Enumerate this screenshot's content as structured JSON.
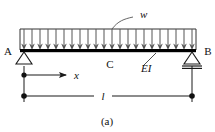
{
  "figure": {
    "caption": "(a)",
    "type": "engineering-beam-diagram"
  },
  "labels": {
    "support_left": "A",
    "support_right": "B",
    "midspan_point": "C",
    "distributed_load": "w",
    "flexural_rigidity": "EI",
    "coordinate_axis": "x",
    "span_length": "l"
  },
  "colors": {
    "line": "#1a1a1a",
    "beam": "#000000",
    "load_arrow": "#555555",
    "background": "#ffffff"
  },
  "geometry": {
    "beam_left_x": 20,
    "beam_right_x": 196,
    "beam_y": 50,
    "load_top_y": 29,
    "arrow_count": 22,
    "support_left_type": "pin",
    "support_right_type": "roller",
    "dimension_line_y": 96,
    "axis_line_y": 75
  }
}
